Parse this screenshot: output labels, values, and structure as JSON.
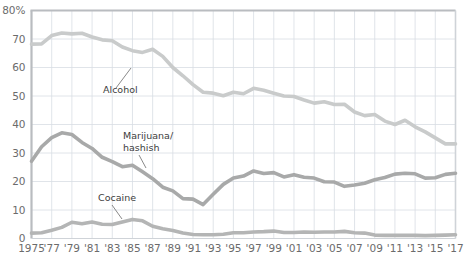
{
  "chart_data": {
    "type": "line",
    "title": "",
    "xlabel": "",
    "ylabel": "",
    "ylim": [
      0,
      80
    ],
    "xlim": [
      1975,
      2017
    ],
    "grid": true,
    "legend_position": "inline-annotations",
    "ytick_labels": [
      "0",
      "10",
      "20",
      "30",
      "40",
      "50",
      "60",
      "70",
      "80%"
    ],
    "ytick_values": [
      0,
      10,
      20,
      30,
      40,
      50,
      60,
      70,
      80
    ],
    "xtick_labels": [
      "1975",
      "'77",
      "'79",
      "'81",
      "'83",
      "'85",
      "'87",
      "'89",
      "'91",
      "'93",
      "'95",
      "'97",
      "'99",
      "'01",
      "'03",
      "'05",
      "'07",
      "'09",
      "'11",
      "'13",
      "'15",
      "'17"
    ],
    "xtick_values": [
      1975,
      1977,
      1979,
      1981,
      1983,
      1985,
      1987,
      1989,
      1991,
      1993,
      1995,
      1997,
      1999,
      2001,
      2003,
      2005,
      2007,
      2009,
      2011,
      2013,
      2015,
      2017
    ],
    "x": [
      1975,
      1976,
      1977,
      1978,
      1979,
      1980,
      1981,
      1982,
      1983,
      1984,
      1985,
      1986,
      1987,
      1988,
      1989,
      1990,
      1991,
      1992,
      1993,
      1994,
      1995,
      1996,
      1997,
      1998,
      1999,
      2000,
      2001,
      2002,
      2003,
      2004,
      2005,
      2006,
      2007,
      2008,
      2009,
      2010,
      2011,
      2012,
      2013,
      2014,
      2015,
      2016,
      2017
    ],
    "series": [
      {
        "name": "Alcohol",
        "color": "#c9cbcb",
        "values": [
          68.2,
          68.3,
          71.2,
          72.1,
          71.8,
          72.0,
          70.7,
          69.7,
          69.4,
          67.2,
          65.9,
          65.3,
          66.4,
          63.9,
          60.0,
          57.1,
          54.0,
          51.3,
          51.0,
          50.1,
          51.3,
          50.8,
          52.7,
          52.0,
          51.0,
          50.0,
          49.8,
          48.6,
          47.5,
          48.0,
          47.0,
          47.1,
          44.4,
          43.1,
          43.5,
          41.2,
          40.0,
          41.5,
          39.2,
          37.4,
          35.3,
          33.2,
          33.2
        ]
      },
      {
        "name": "Marijuana/hashish",
        "color": "#a8a9a9",
        "values": [
          27.1,
          32.2,
          35.4,
          37.1,
          36.5,
          33.7,
          31.6,
          28.5,
          27.0,
          25.2,
          25.7,
          23.4,
          21.0,
          18.0,
          16.7,
          14.0,
          13.8,
          11.9,
          15.5,
          19.0,
          21.2,
          21.9,
          23.7,
          22.8,
          23.1,
          21.6,
          22.4,
          21.5,
          21.2,
          19.9,
          19.8,
          18.3,
          18.8,
          19.4,
          20.6,
          21.4,
          22.6,
          22.9,
          22.7,
          21.2,
          21.3,
          22.5,
          22.9
        ]
      },
      {
        "name": "Cocaine",
        "color": "#b4b5b5",
        "values": [
          1.9,
          2.0,
          2.9,
          3.9,
          5.7,
          5.2,
          5.8,
          5.0,
          4.9,
          5.8,
          6.7,
          6.2,
          4.3,
          3.4,
          2.8,
          1.9,
          1.4,
          1.3,
          1.3,
          1.5,
          2.0,
          2.0,
          2.3,
          2.4,
          2.6,
          2.1,
          2.1,
          2.3,
          2.2,
          2.3,
          2.3,
          2.5,
          2.0,
          1.9,
          1.2,
          1.1,
          1.1,
          1.1,
          1.1,
          1.0,
          1.1,
          1.2,
          1.3
        ]
      }
    ],
    "annotations": [
      {
        "label": "Alcohol",
        "x": 103,
        "y": 93
      },
      {
        "label": "Marijuana/",
        "x": 123,
        "y": 139
      },
      {
        "label": "hashish",
        "x": 123,
        "y": 151
      },
      {
        "label": "Cocaine",
        "x": 98,
        "y": 201
      }
    ]
  },
  "colors": {
    "background": "#ffffff",
    "grid": "#d8dde3",
    "frame": "#b9bcc0",
    "tick_text": "#6b6b6b",
    "label_text": "#3d3d3d"
  }
}
